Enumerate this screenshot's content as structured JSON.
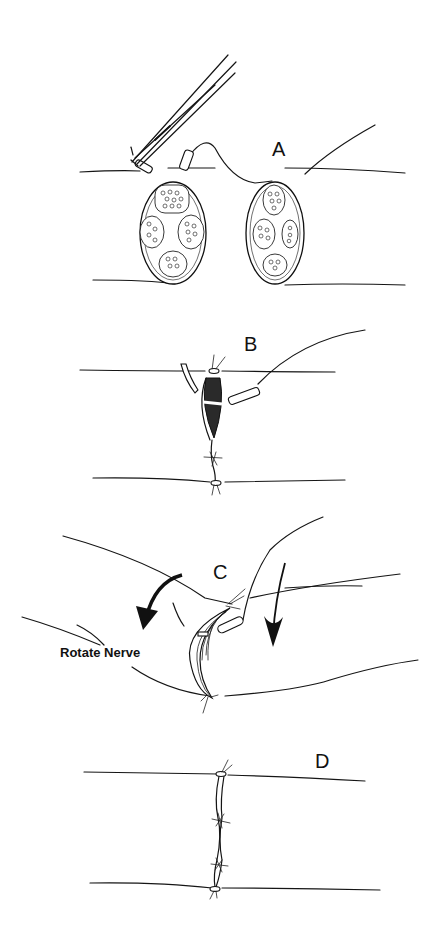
{
  "figure": {
    "panels": [
      {
        "id": "A",
        "label": "A",
        "content": "Two cut nerve ends with fascicles; needle holder passing suture through epineurium"
      },
      {
        "id": "B",
        "label": "B",
        "content": "Nerve ends approximated with sutures; gap partially closed"
      },
      {
        "id": "C",
        "label": "C",
        "content": "Nerve rotated to expose back wall for suturing",
        "annotation": "Rotate Nerve"
      },
      {
        "id": "D",
        "label": "D",
        "content": "Completed repair with interrupted epineurial sutures"
      }
    ]
  },
  "colors": {
    "ink": "#151515",
    "background": "#ffffff"
  }
}
